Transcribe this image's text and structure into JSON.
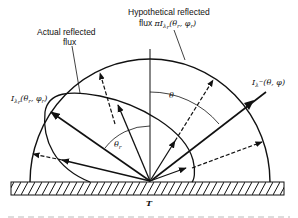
{
  "diagram": {
    "labels": {
      "hypothetical_line1": "Hypothetical reflected",
      "hypothetical_line2_prefix": "flux ",
      "hypothetical_pi": "π",
      "hypothetical_I": "I",
      "hypothetical_sub": "λ",
      "hypothetical_sub2": "r",
      "hypothetical_args": "(θ",
      "hypothetical_args_r1": "r",
      "hypothetical_args_mid": ", φ",
      "hypothetical_args_r2": "r",
      "hypothetical_args_end": ")",
      "actual_line1": "Actual reflected",
      "actual_line2": "flux",
      "reflected_I": "I",
      "reflected_sub": "λ",
      "reflected_sub2": "r",
      "reflected_args": "(θ",
      "reflected_args_r1": "r",
      "reflected_args_mid": ", φ",
      "reflected_args_r2": "r",
      "reflected_args_end": ")",
      "incident_I": "I",
      "incident_sub": "λ",
      "incident_sup": "−",
      "incident_args": "(θ, φ)",
      "theta": "θ",
      "theta_r": "θ",
      "theta_r_sub": "r",
      "surface_temp": "T"
    },
    "elements": {
      "hemisphere": "hypothetical diffuse reflected flux envelope",
      "lobe": "actual reflected flux distribution",
      "incident_ray": "incident intensity",
      "surface": "hatched surface"
    }
  }
}
